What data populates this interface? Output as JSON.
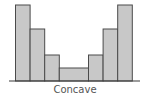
{
  "chart_data": {
    "type": "bar",
    "title": "",
    "xlabel": "Concave",
    "ylabel": "",
    "categories": [
      "1",
      "2",
      "3",
      "4",
      "5",
      "6",
      "7"
    ],
    "values": [
      76,
      52,
      26,
      13,
      26,
      52,
      76
    ],
    "widths": [
      1,
      1,
      1,
      2,
      1,
      1,
      1
    ],
    "ylim": [
      0,
      80
    ],
    "grid": false,
    "legend": null,
    "colors": {
      "bar_fill": "#c8c8c8",
      "bar_stroke": "#4a4a4a",
      "axis": "#3a3a3a",
      "label": "#555555"
    }
  },
  "caption": "Concave"
}
